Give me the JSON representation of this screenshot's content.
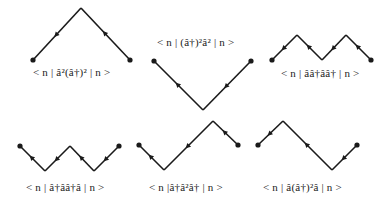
{
  "colors": {
    "line": "#1a1a1a",
    "text": "#222222",
    "background": "#ffffff"
  },
  "panels": [
    {
      "id": "p1",
      "label": "< n | â²(â†)² | n >",
      "label_pos": [
        33,
        68
      ],
      "points": [
        [
          33,
          60
        ],
        [
          81,
          8
        ],
        [
          130,
          60
        ]
      ],
      "arrows": [
        [
          57,
          34,
          "down"
        ],
        [
          105,
          34,
          "up"
        ],
        [
          70,
          20,
          "none"
        ]
      ]
    },
    {
      "id": "p2",
      "label": "< n | (â†)²â² | n >",
      "label_pos": [
        158,
        34
      ],
      "points": [
        [
          154,
          61
        ],
        [
          203,
          110
        ],
        [
          251,
          61
        ]
      ],
      "arrows": []
    },
    {
      "id": "p3",
      "label": "< n | ââ†ââ† | n >",
      "label_pos": [
        282,
        69
      ],
      "points": [
        [
          272,
          60
        ],
        [
          297,
          35
        ],
        [
          322,
          60
        ],
        [
          346,
          35
        ],
        [
          371,
          60
        ]
      ],
      "arrows": []
    },
    {
      "id": "p4",
      "label": "< n | â†ââ†â | n >",
      "label_pos": [
        26,
        185
      ],
      "points": [
        [
          20,
          146
        ],
        [
          45,
          171
        ],
        [
          70,
          146
        ],
        [
          94,
          171
        ],
        [
          119,
          146
        ]
      ],
      "arrows": []
    },
    {
      "id": "p5",
      "label": "< n |â†â²â† | n >",
      "label_pos": [
        150,
        185
      ],
      "points": [
        [
          139,
          145
        ],
        [
          164,
          170
        ],
        [
          213,
          121
        ],
        [
          238,
          145
        ]
      ],
      "arrows": []
    },
    {
      "id": "p6",
      "label": "< n | â(â†)²â | n >",
      "label_pos": [
        265,
        185
      ],
      "points": [
        [
          258,
          145
        ],
        [
          283,
          121
        ],
        [
          332,
          170
        ],
        [
          357,
          145
        ]
      ],
      "arrows": []
    }
  ]
}
